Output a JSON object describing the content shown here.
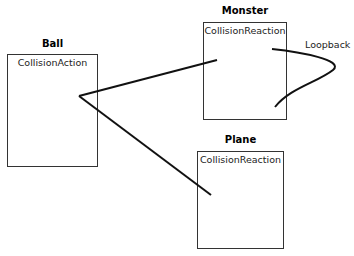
{
  "objects": [
    {
      "id": "ball",
      "name": "Ball",
      "method": "CollisionAction"
    },
    {
      "id": "monster",
      "name": "Monster",
      "method": "CollisionReaction"
    },
    {
      "id": "plane",
      "name": "Plane",
      "method": "CollisionReaction"
    }
  ],
  "connections": [
    {
      "from": "ball",
      "to": "monster"
    },
    {
      "from": "ball",
      "to": "plane"
    },
    {
      "from": "monster",
      "to": "monster",
      "label": "Loopback"
    }
  ],
  "loopback_label": "Loopback",
  "colors": {
    "stroke": "#111111",
    "box_border": "#333333"
  }
}
